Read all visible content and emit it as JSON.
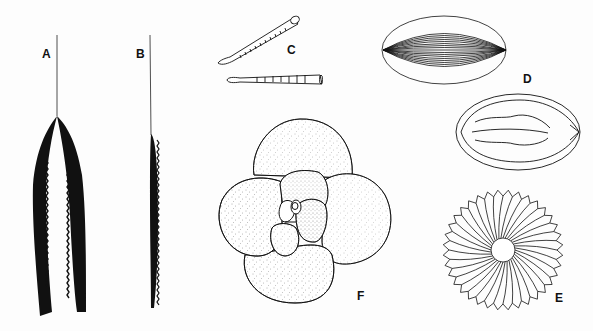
{
  "figure": {
    "panels": [
      {
        "id": "A",
        "label": "A",
        "description": "forked spicule, two black serrated blades joined to a thin stalk"
      },
      {
        "id": "B",
        "label": "B",
        "description": "single black serrated blade on a thin stalk"
      },
      {
        "id": "C",
        "label": "C",
        "description": "two tapered rod-shaped spicules, one with oblique striations, one segmented"
      },
      {
        "id": "D",
        "label": "D",
        "description": "ellipsoidal body with longitudinal ribs"
      },
      {
        "id": "D2",
        "label": "",
        "description": "oval outline with wavy internal slit-like lines"
      },
      {
        "id": "E",
        "label": "E",
        "description": "radial rosette with ~36 ribbed segments around a central pore"
      },
      {
        "id": "F",
        "label": "F",
        "description": "globigerinid foraminifer test with stippled spherical chambers in a spiral"
      }
    ],
    "colors": {
      "ink": "#111111",
      "paper": "#fdfdfd"
    }
  }
}
